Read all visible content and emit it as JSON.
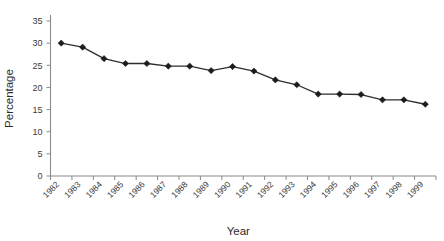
{
  "chart_data": {
    "type": "line",
    "title": "",
    "xlabel": "Year",
    "ylabel": "Percentage",
    "categories": [
      "1982",
      "1983",
      "1984",
      "1985",
      "1986",
      "1987",
      "1988",
      "1989",
      "1990",
      "1991",
      "1992",
      "1993",
      "1994",
      "1995",
      "1996",
      "1997",
      "1998",
      "1999"
    ],
    "values": [
      30.0,
      29.1,
      26.5,
      25.4,
      25.4,
      24.8,
      24.8,
      23.8,
      24.7,
      23.7,
      21.7,
      20.6,
      18.5,
      18.5,
      18.4,
      17.2,
      17.2,
      16.2
    ],
    "series": [
      {
        "name": "Percentage",
        "values": [
          30.0,
          29.1,
          26.5,
          25.4,
          25.4,
          24.8,
          24.8,
          23.8,
          24.7,
          23.7,
          21.7,
          20.6,
          18.5,
          18.5,
          18.4,
          17.2,
          17.2,
          16.2
        ],
        "color": "#1c1c1c",
        "marker": "diamond"
      }
    ],
    "ylim": [
      0,
      35
    ],
    "ytick_step": 5,
    "yticks": [
      "0",
      "5",
      "10",
      "15",
      "20",
      "25",
      "30",
      "35"
    ],
    "grid": false,
    "legend": false,
    "legend_position": "none",
    "x_tick_label_rotation": -45,
    "annotations": []
  },
  "axes": {
    "y_axis_title": "Percentage",
    "x_axis_title": "Year"
  }
}
